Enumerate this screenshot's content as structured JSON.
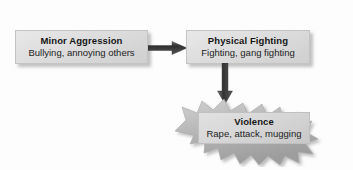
{
  "diagram": {
    "type": "flow-progression",
    "stages": [
      {
        "id": "minor-aggression",
        "title": "Minor Aggression",
        "subtitle": "Bullying, annoying others",
        "shape": "rectangle"
      },
      {
        "id": "physical-fighting",
        "title": "Physical Fighting",
        "subtitle": "Fighting, gang fighting",
        "shape": "rectangle"
      },
      {
        "id": "violence",
        "title": "Violence",
        "subtitle": "Rape, attack, mugging",
        "shape": "starburst"
      }
    ],
    "connectors": [
      {
        "id": "minor-to-physical",
        "icon": "arrow-right-icon",
        "direction": "right"
      },
      {
        "id": "physical-to-violence",
        "icon": "arrow-down-icon",
        "direction": "down"
      }
    ]
  },
  "colors": {
    "background": "#fdfdfd",
    "box_fill_light": "#e8e8e8",
    "box_fill_dark": "#cfcfcf",
    "box_border": "#c4c4c4",
    "burst_fill": "#b9b9b9",
    "arrow": "#3a3a3a",
    "text": "#161616",
    "copyright_text": "#8a8a8a"
  },
  "credit": {
    "copyright": "Copyright © 2012 Wadsworth, Cengage Learning, Inc."
  }
}
